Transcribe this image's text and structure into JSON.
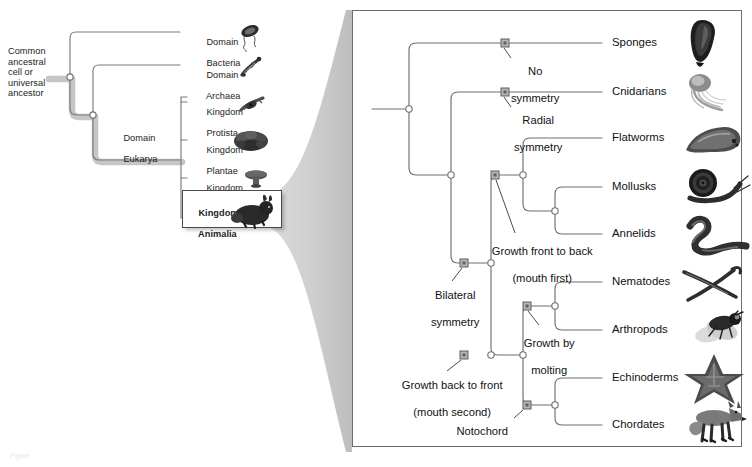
{
  "figure": {
    "caption": "Figure"
  },
  "left_tree": {
    "root_label": "Common\nancestral\ncell or\nuniversal\nancestor",
    "root_label_lines": [
      "Common",
      "ancestral",
      "cell or",
      "universal",
      "ancestor"
    ],
    "eukarya_label_lines": [
      "Domain",
      "Eukarya"
    ],
    "branches": [
      {
        "id": "bacteria",
        "label_lines": [
          "Domain",
          "Bacteria"
        ],
        "icon": "bacterium-icon"
      },
      {
        "id": "archaea",
        "label_lines": [
          "Domain",
          "Archaea"
        ],
        "icon": "archaeon-icon"
      },
      {
        "id": "protista",
        "label_lines": [
          "Kingdom",
          "Protista"
        ],
        "icon": "protist-icon"
      },
      {
        "id": "plantae",
        "label_lines": [
          "Kingdom",
          "Plantae"
        ],
        "icon": "plant-icon"
      },
      {
        "id": "fungi",
        "label_lines": [
          "Kingdom",
          "Fungi"
        ],
        "icon": "mushroom-icon"
      },
      {
        "id": "animalia",
        "label_lines": [
          "Kingdom",
          "Animalia"
        ],
        "icon": "rabbit-icon",
        "highlighted": true
      }
    ]
  },
  "right_tree": {
    "taxa": [
      {
        "id": "sponges",
        "label": "Sponges",
        "icon": "sponge-icon"
      },
      {
        "id": "cnidarians",
        "label": "Cnidarians",
        "icon": "jellyfish-icon"
      },
      {
        "id": "flatworms",
        "label": "Flatworms",
        "icon": "flatworm-icon"
      },
      {
        "id": "mollusks",
        "label": "Mollusks",
        "icon": "snail-icon"
      },
      {
        "id": "annelids",
        "label": "Annelids",
        "icon": "earthworm-icon"
      },
      {
        "id": "nematodes",
        "label": "Nematodes",
        "icon": "roundworm-icon"
      },
      {
        "id": "arthropods",
        "label": "Arthropods",
        "icon": "fly-icon"
      },
      {
        "id": "echinoderms",
        "label": "Echinoderms",
        "icon": "starfish-icon"
      },
      {
        "id": "chordates",
        "label": "Chordates",
        "icon": "fox-icon"
      }
    ],
    "traits": [
      {
        "id": "no-symmetry",
        "label_lines": [
          "No",
          "symmetry"
        ]
      },
      {
        "id": "radial-symmetry",
        "label_lines": [
          "Radial",
          "symmetry"
        ]
      },
      {
        "id": "bilateral-symmetry",
        "label_lines": [
          "Bilateral",
          "symmetry"
        ]
      },
      {
        "id": "growth-front-to-back",
        "label_lines": [
          "Growth front to back",
          "(mouth first)"
        ]
      },
      {
        "id": "growth-by-molting",
        "label_lines": [
          "Growth by",
          "molting"
        ]
      },
      {
        "id": "growth-back-to-front",
        "label_lines": [
          "Growth back to front",
          "(mouth second)"
        ]
      },
      {
        "id": "notochord",
        "label_lines": [
          "Notochord"
        ]
      }
    ]
  },
  "colors": {
    "branch_line": "#6f6f6f",
    "node_fill": "#ffffff",
    "node_stroke": "#6f6f6f",
    "trait_marker": "#9a9a9a",
    "trait_marker_stroke": "#5e5e5e",
    "text": "#1c1c1c",
    "panel_border": "#6d6d6d",
    "fan_fill": "#c9c9c9",
    "shadow": "#b8b8b8"
  }
}
